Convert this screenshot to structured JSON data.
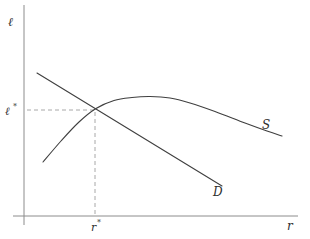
{
  "chart_data": {
    "type": "line",
    "title": "",
    "xlabel": "r",
    "ylabel": "ℓ",
    "grid": false,
    "legend": "none (curves labeled inline: S upper right, D lower middle)",
    "units": "screen_px, y increases downward; axes origin at (24,216)",
    "axes_px": {
      "x_axis": [
        [
          13,
          216
        ],
        [
          298,
          216
        ]
      ],
      "y_axis": [
        [
          24,
          5
        ],
        [
          24,
          225
        ]
      ]
    },
    "series": [
      {
        "name": "S",
        "slug": "supply-curve",
        "shape": "rises steeply from lower left, passes equilibrium, peaks near x=150 then declines gently to the right",
        "smooth": true,
        "points_px": [
          [
            43,
            162
          ],
          [
            61,
            141
          ],
          [
            79,
            122
          ],
          [
            96,
            108.5
          ],
          [
            114,
            100.5
          ],
          [
            132,
            97.5
          ],
          [
            150,
            96.5
          ],
          [
            170,
            98
          ],
          [
            190,
            103
          ],
          [
            215,
            111.5
          ],
          [
            245,
            123
          ],
          [
            267,
            131
          ],
          [
            282,
            136
          ]
        ]
      },
      {
        "name": "D",
        "slug": "demand-curve",
        "shape": "straight downward-sloping line",
        "smooth": false,
        "points_px": [
          [
            37,
            73
          ],
          [
            222,
            186
          ]
        ]
      }
    ],
    "equilibrium": {
      "x_px": 95,
      "y_px": 110,
      "x_label": "r*",
      "y_label": "ℓ*"
    },
    "guides_px": [
      {
        "name": "l-star-dashed-line",
        "from": [
          27,
          110
        ],
        "to": [
          94,
          110
        ]
      },
      {
        "name": "r-star-dashed-line",
        "from": [
          95,
          112
        ],
        "to": [
          95,
          215
        ]
      }
    ],
    "colors": {
      "curve": "#3f3f3f",
      "axis": "#8c8c8c",
      "guide": "#9e9e9e",
      "text": "#2e2e2e"
    }
  },
  "labels": {
    "y_axis": "ℓ",
    "x_axis": "r",
    "supply": "S",
    "demand": "D",
    "l_star": {
      "base": "ℓ",
      "sup": "*"
    },
    "r_star": {
      "base": "r",
      "sup": "*"
    }
  }
}
